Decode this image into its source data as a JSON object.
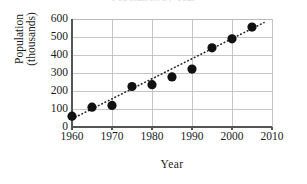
{
  "chart_data": {
    "type": "scatter",
    "title": "Population by Year",
    "title_visible": false,
    "xlabel": "Year",
    "ylabel": "Population (thousands)",
    "ylabel_line1": "Population",
    "ylabel_line2": "(thousands)",
    "x": [
      1960,
      1965,
      1970,
      1975,
      1980,
      1985,
      1990,
      1995,
      2000,
      2005
    ],
    "values": [
      60,
      110,
      120,
      225,
      235,
      278,
      322,
      440,
      490,
      555
    ],
    "points": [
      {
        "x": 1960,
        "y": 60
      },
      {
        "x": 1965,
        "y": 110
      },
      {
        "x": 1970,
        "y": 120
      },
      {
        "x": 1975,
        "y": 225
      },
      {
        "x": 1980,
        "y": 235
      },
      {
        "x": 1985,
        "y": 278
      },
      {
        "x": 1990,
        "y": 322
      },
      {
        "x": 1995,
        "y": 440
      },
      {
        "x": 2000,
        "y": 490
      },
      {
        "x": 2005,
        "y": 555
      }
    ],
    "xlim": [
      1960,
      2010
    ],
    "ylim": [
      0,
      600
    ],
    "xticks": [
      1960,
      1970,
      1980,
      1990,
      2000,
      2010
    ],
    "yticks": [
      0,
      100,
      200,
      300,
      400,
      500,
      600
    ],
    "grid": true,
    "legend": null,
    "trendline": {
      "visible": true,
      "style": "dotted",
      "x_start": 1960,
      "y_start": 45,
      "x_end": 2008,
      "y_end": 580
    },
    "marker": {
      "shape": "circle",
      "color": "#111111",
      "radius_px": 4.6
    },
    "colors": {
      "axis": "#555555",
      "grid": "#b8b8b8",
      "marker": "#111111",
      "trendline": "#222222",
      "text": "#1a1a1a",
      "background": "#ffffff"
    }
  }
}
